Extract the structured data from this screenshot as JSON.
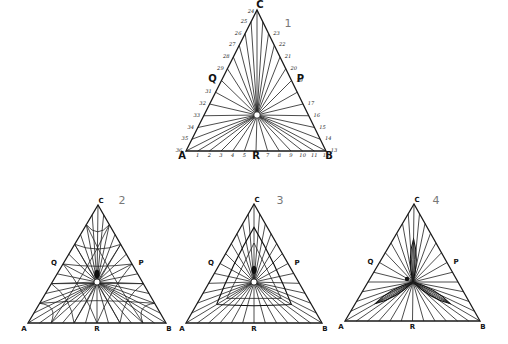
{
  "figure": {
    "panels": [
      {
        "id": "1",
        "label": "1",
        "vertices": {
          "A": "A",
          "B": "B",
          "C": "C"
        },
        "midpoints": {
          "P": "P",
          "Q": "Q",
          "R": "R"
        },
        "geom": {
          "A": [
            186,
            151
          ],
          "B": [
            326,
            151
          ],
          "C": [
            257,
            10
          ],
          "O": [
            257,
            115
          ],
          "num": [
            288,
            27
          ]
        },
        "bottom_ticks": [
          "1",
          "2",
          "3",
          "4",
          "5",
          "R",
          "7",
          "8",
          "9",
          "10",
          "11",
          "12"
        ],
        "right_ticks": [
          "13",
          "14",
          "15",
          "16",
          "17",
          "P",
          "19",
          "20",
          "21",
          "22",
          "23"
        ],
        "left_ticks": [
          "25",
          "26",
          "27",
          "28",
          "29",
          "Q",
          "31",
          "32",
          "33",
          "34",
          "35",
          "36"
        ],
        "apex_tick": "24",
        "style": "star"
      },
      {
        "id": "2",
        "label": "2",
        "vertices": {
          "A": "A",
          "B": "B",
          "C": "C"
        },
        "midpoints": {
          "P": "P",
          "Q": "Q",
          "R": "R"
        },
        "geom": {
          "A": [
            28,
            323
          ],
          "B": [
            166,
            323
          ],
          "C": [
            98,
            205
          ],
          "O": [
            97,
            282
          ],
          "num": [
            122,
            204
          ]
        },
        "style": "web"
      },
      {
        "id": "3",
        "label": "3",
        "vertices": {
          "A": "A",
          "B": "B",
          "C": "C"
        },
        "midpoints": {
          "P": "P",
          "Q": "Q",
          "R": "R"
        },
        "geom": {
          "A": [
            186,
            323
          ],
          "B": [
            322,
            323
          ],
          "C": [
            254,
            204
          ],
          "O": [
            254,
            282
          ],
          "num": [
            280,
            204
          ]
        },
        "style": "inner-triangle"
      },
      {
        "id": "4",
        "label": "4",
        "vertices": {
          "A": "A",
          "B": "B",
          "C": "C"
        },
        "midpoints": {
          "P": "P",
          "Q": "Q",
          "R": "R"
        },
        "geom": {
          "A": [
            345,
            321
          ],
          "B": [
            480,
            321
          ],
          "C": [
            414,
            204
          ],
          "O": [
            413,
            282
          ],
          "num": [
            436,
            204
          ]
        },
        "style": "trefoil"
      }
    ]
  }
}
